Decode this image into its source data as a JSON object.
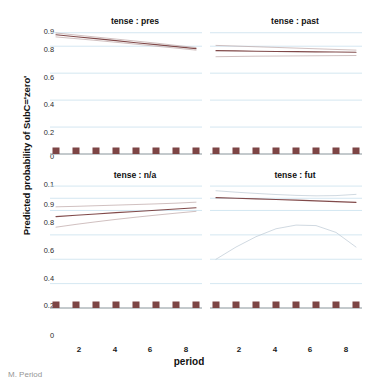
{
  "figure": {
    "ylabel": "Predicted probability of SubC='zero'",
    "xlabel": "period",
    "caption": "M. Period"
  },
  "colors": {
    "grid": "#cfe4ef",
    "fit_line": "#7a4040",
    "ci_line": "#b9a2a2",
    "ci_line_blue": "#b9c6d2",
    "rug": "#7d4545",
    "axis": "#8a8a8a",
    "text": "#111111"
  },
  "axes": {
    "y_ticks_top": [
      "0.9",
      "0.8",
      "0.6",
      "0.4",
      "0.2",
      "0"
    ],
    "y_ticks_bottom": [
      "0.1",
      "0.9",
      "0.8",
      "0.6",
      "0.4",
      "0.2",
      "0"
    ],
    "x_ticks": [
      "2",
      "4",
      "6",
      "8"
    ]
  },
  "chart_data": {
    "type": "line",
    "title": "",
    "xlabel": "period",
    "ylabel": "Predicted probability of SubC='zero'",
    "xlim": [
      1,
      8
    ],
    "ylim": [
      0.0,
      1.0
    ],
    "grid": true,
    "legend": "none",
    "x": [
      1,
      2,
      3,
      4,
      5,
      6,
      7,
      8
    ],
    "facets": [
      {
        "name": "tense : pres",
        "row": 0,
        "col": 0,
        "series": [
          {
            "name": "fit",
            "values": [
              0.885,
              0.87,
              0.856,
              0.841,
              0.826,
              0.812,
              0.797,
              0.782
            ]
          },
          {
            "name": "ci_upper",
            "values": [
              0.898,
              0.883,
              0.868,
              0.853,
              0.838,
              0.823,
              0.806,
              0.79
            ]
          },
          {
            "name": "ci_lower",
            "values": [
              0.869,
              0.856,
              0.843,
              0.829,
              0.815,
              0.8,
              0.786,
              0.771
            ]
          }
        ],
        "rug": [
          1,
          2,
          3,
          4,
          5,
          6,
          7,
          8
        ]
      },
      {
        "name": "tense : past",
        "row": 0,
        "col": 1,
        "series": [
          {
            "name": "fit",
            "values": [
              0.767,
              0.765,
              0.763,
              0.761,
              0.76,
              0.758,
              0.757,
              0.755
            ]
          },
          {
            "name": "ci_upper",
            "values": [
              0.806,
              0.801,
              0.796,
              0.791,
              0.786,
              0.781,
              0.776,
              0.771
            ]
          },
          {
            "name": "ci_lower",
            "values": [
              0.722,
              0.724,
              0.726,
              0.727,
              0.728,
              0.729,
              0.73,
              0.731
            ]
          }
        ],
        "rug": [
          1,
          2,
          3,
          4,
          5,
          6,
          7,
          8
        ]
      },
      {
        "name": "tense : n/a",
        "row": 1,
        "col": 0,
        "series": [
          {
            "name": "fit",
            "values": [
              0.75,
              0.761,
              0.771,
              0.782,
              0.792,
              0.802,
              0.812,
              0.822
            ]
          },
          {
            "name": "ci_upper",
            "values": [
              0.83,
              0.834,
              0.839,
              0.844,
              0.849,
              0.854,
              0.86,
              0.868
            ]
          },
          {
            "name": "ci_lower",
            "values": [
              0.663,
              0.686,
              0.707,
              0.727,
              0.745,
              0.762,
              0.778,
              0.793
            ]
          }
        ],
        "rug": [
          1,
          2,
          3,
          4,
          5,
          6,
          7,
          8
        ]
      },
      {
        "name": "tense : fut",
        "row": 1,
        "col": 1,
        "series": [
          {
            "name": "fit",
            "values": [
              0.905,
              0.9,
              0.895,
              0.89,
              0.885,
              0.879,
              0.873,
              0.867
            ]
          },
          {
            "name": "ci_upper",
            "values": [
              0.962,
              0.95,
              0.94,
              0.931,
              0.924,
              0.92,
              0.922,
              0.932
            ]
          },
          {
            "name": "ci_lower",
            "values": [
              0.4,
              0.5,
              0.585,
              0.65,
              0.68,
              0.676,
              0.62,
              0.5
            ]
          }
        ],
        "rug": [
          1,
          2,
          3,
          4,
          5,
          6,
          7,
          8
        ]
      }
    ]
  }
}
